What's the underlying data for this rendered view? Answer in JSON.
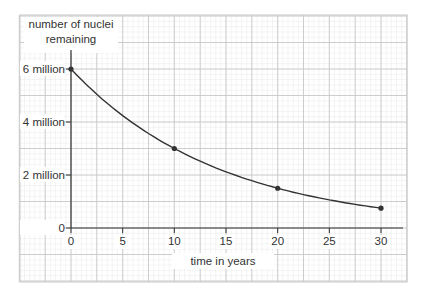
{
  "chart_data": {
    "type": "line",
    "title": "",
    "ylabel": "number of nuclei remaining",
    "ylabel_lines": [
      "number of nuclei",
      "remaining"
    ],
    "xlabel": "time in years",
    "x": [
      0,
      10,
      20,
      30
    ],
    "series": [
      {
        "name": "nuclei remaining",
        "values": [
          6000000,
          3000000,
          1500000,
          750000
        ],
        "marked_points": true
      }
    ],
    "xticks": [
      0,
      5,
      10,
      15,
      20,
      25,
      30
    ],
    "xtick_labels": [
      "0",
      "5",
      "10",
      "15",
      "20",
      "25",
      "30"
    ],
    "yticks": [
      0,
      2000000,
      4000000,
      6000000
    ],
    "ytick_labels": [
      "0",
      "2 million",
      "4 million",
      "6 million"
    ],
    "xlim": [
      0,
      30
    ],
    "ylim": [
      0,
      6000000
    ],
    "grid": true,
    "legend": null
  },
  "colors": {
    "curve": "#333333",
    "axis": "#333333",
    "grid_major": "#c8c8c8",
    "grid_minor": "#ececec",
    "text": "#333333"
  }
}
